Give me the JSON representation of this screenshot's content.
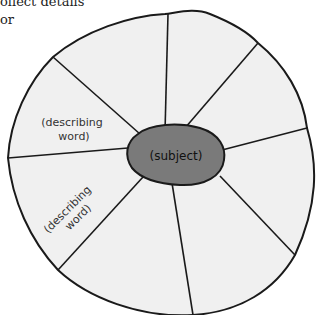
{
  "header": {
    "line1": "ollect details",
    "line2": " or"
  },
  "diagram": {
    "type": "word-web",
    "center_label": "(subject)",
    "segment_labels": [
      {
        "line1": "(describing",
        "line2": "word)"
      },
      {
        "line1": "(describing",
        "line2": "word)"
      }
    ],
    "segment_count": 8,
    "colors": {
      "outer_fill": "#f0f0f0",
      "center_fill": "#7a7a7a",
      "stroke": "#1a1a1a"
    }
  }
}
